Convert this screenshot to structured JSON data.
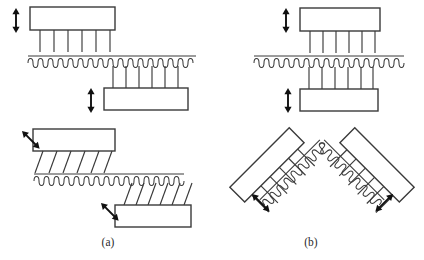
{
  "figure": {
    "background_color": "#ffffff",
    "line_color": "#3a3a3a",
    "arrow_color": "#111111",
    "width": 424,
    "height": 260
  },
  "panels": [
    {
      "id": "a",
      "label": "(a)",
      "label_x": 108,
      "label_y": 246,
      "description": "Flat opposed bristle packs with vertical and inclined bristles"
    },
    {
      "id": "b",
      "label": "(b)",
      "label_x": 311,
      "label_y": 246,
      "description": "Flat bristle packs and V-shaped opposed bristle pack arrangement"
    }
  ],
  "assemblies": [
    {
      "name": "panel-a-upper-block",
      "panel": "a",
      "block": {
        "x": 30,
        "y": 7,
        "width": 85,
        "height": 23,
        "rotation": 0
      },
      "bristles": {
        "count": 6,
        "length": 22,
        "angle_deg": 0,
        "side": "bottom"
      },
      "arrow": {
        "x": 16,
        "y1": 8,
        "y2": 33,
        "angle_deg": 0,
        "type": "double-headed"
      }
    },
    {
      "name": "panel-a-upper-coil",
      "panel": "a",
      "coil": {
        "x1": 28,
        "y1": 59,
        "x2": 196,
        "y2": 59,
        "loops": 33,
        "angle_deg": 0
      }
    },
    {
      "name": "panel-a-lower-block",
      "panel": "a",
      "block": {
        "x": 104,
        "y": 88,
        "width": 84,
        "height": 22,
        "rotation": 0
      },
      "bristles": {
        "count": 6,
        "length": 22,
        "angle_deg": 0,
        "side": "top"
      },
      "arrow": {
        "x": 91,
        "y1": 88,
        "y2": 112,
        "angle_deg": 0,
        "type": "double-headed"
      }
    },
    {
      "name": "panel-a-inclined-upper-block",
      "panel": "a",
      "block": {
        "x": 33,
        "y": 129,
        "width": 82,
        "height": 22,
        "rotation": 0
      },
      "bristles": {
        "count": 6,
        "length": 24,
        "angle_deg": 20,
        "side": "bottom"
      },
      "arrow": {
        "x": 19,
        "y1": 131,
        "y2": 155,
        "angle_deg": -45,
        "type": "double-headed"
      }
    },
    {
      "name": "panel-a-lower-coil",
      "panel": "a",
      "coil": {
        "x1": 34,
        "y1": 177,
        "x2": 184,
        "y2": 177,
        "loops": 30,
        "angle_deg": 0
      }
    },
    {
      "name": "panel-a-inclined-lower-block",
      "panel": "a",
      "block": {
        "x": 115,
        "y": 205,
        "width": 76,
        "height": 22,
        "rotation": 0
      },
      "bristles": {
        "count": 6,
        "length": 23,
        "angle_deg": -20,
        "side": "top"
      },
      "arrow": {
        "x": 98,
        "y1": 203,
        "y2": 226,
        "angle_deg": -45,
        "type": "double-headed"
      }
    },
    {
      "name": "panel-b-upper-block",
      "panel": "b",
      "block": {
        "x": 300,
        "y": 8,
        "width": 80,
        "height": 23,
        "rotation": 0
      },
      "bristles": {
        "count": 6,
        "length": 23,
        "angle_deg": 0,
        "side": "bottom"
      },
      "arrow": {
        "x": 286,
        "y1": 8,
        "y2": 32,
        "angle_deg": 0,
        "type": "double-headed"
      }
    },
    {
      "name": "panel-b-coil",
      "panel": "b",
      "coil": {
        "x1": 254,
        "y1": 59,
        "x2": 404,
        "y2": 59,
        "loops": 30,
        "angle_deg": 0
      }
    },
    {
      "name": "panel-b-lower-block",
      "panel": "b",
      "block": {
        "x": 300,
        "y": 89,
        "width": 78,
        "height": 22,
        "rotation": 0
      },
      "bristles": {
        "count": 6,
        "length": 23,
        "angle_deg": 0,
        "side": "top"
      },
      "arrow": {
        "x": 288,
        "y1": 88,
        "y2": 112,
        "angle_deg": 0,
        "type": "double-headed"
      }
    },
    {
      "name": "panel-b-vee-left-arm",
      "panel": "b",
      "block": {
        "x": 243,
        "y": 147,
        "width": 84,
        "height": 21,
        "rotation": -45
      },
      "bristles": {
        "count": 6,
        "length": 24,
        "angle_deg": 0,
        "side": "bottom"
      },
      "arrow": {
        "x": 249,
        "y1": 194,
        "y2": 218,
        "angle_deg": -45,
        "type": "double-headed"
      }
    },
    {
      "name": "panel-b-vee-right-arm",
      "panel": "b",
      "block": {
        "x": 350,
        "y": 147,
        "width": 84,
        "height": 21,
        "rotation": 45
      },
      "bristles": {
        "count": 6,
        "length": 24,
        "angle_deg": 0,
        "side": "bottom"
      },
      "arrow": {
        "x": 393,
        "y1": 194,
        "y2": 218,
        "angle_deg": 45,
        "type": "double-headed"
      }
    },
    {
      "name": "panel-b-vee-coil",
      "panel": "b",
      "coil": {
        "apex_x": 322,
        "apex_y": 142,
        "left_end_x": 258,
        "left_end_y": 222,
        "right_end_x": 386,
        "right_end_y": 222,
        "loops_per_arm": 17
      }
    }
  ]
}
